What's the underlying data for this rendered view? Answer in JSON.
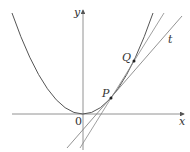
{
  "diagram": {
    "title": "",
    "axes": {
      "x_label": "x",
      "y_label": "y",
      "origin_label": "0"
    },
    "curve": {
      "type": "parabola",
      "description": "y = x^2 style curve"
    },
    "points": [
      {
        "label": "P",
        "x": 111,
        "y": 98
      },
      {
        "label": "Q",
        "x": 134,
        "y": 61
      }
    ],
    "lines": [
      {
        "name": "tangent",
        "label": "t"
      },
      {
        "name": "secant-PQ",
        "label": ""
      }
    ],
    "colors": {
      "stroke": "#555555",
      "axis": "#666666",
      "text": "#333333"
    }
  }
}
